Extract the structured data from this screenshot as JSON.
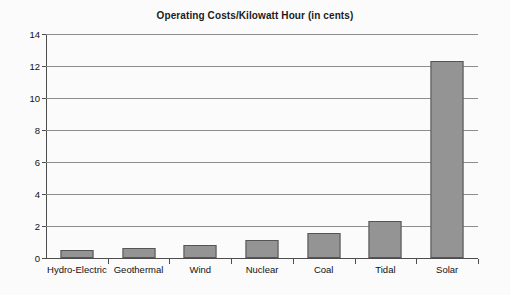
{
  "chart_data": {
    "type": "bar",
    "title": "Operating Costs/Kilowatt Hour (in cents)",
    "xlabel": "",
    "ylabel": "",
    "categories": [
      "Hydro-Electric",
      "Geothermal",
      "Wind",
      "Nuclear",
      "Coal",
      "Tidal",
      "Solar"
    ],
    "values": [
      0.5,
      0.65,
      0.8,
      1.1,
      1.55,
      2.3,
      12.3
    ],
    "ylim": [
      0,
      14
    ],
    "y_ticks": [
      0,
      2,
      4,
      6,
      8,
      10,
      12,
      14
    ],
    "y_tick_labels": [
      "0",
      "2",
      "4",
      "6",
      "8",
      "10",
      "12",
      "14"
    ],
    "grid": true,
    "legend": false,
    "bar_color": "#949494",
    "bar_border_color": "#555555",
    "gridline_color": "#8d8d8d",
    "axis_color": "#4d4d4d",
    "background_color": "#fbfbfb",
    "title_color": "#1b1b1b"
  }
}
